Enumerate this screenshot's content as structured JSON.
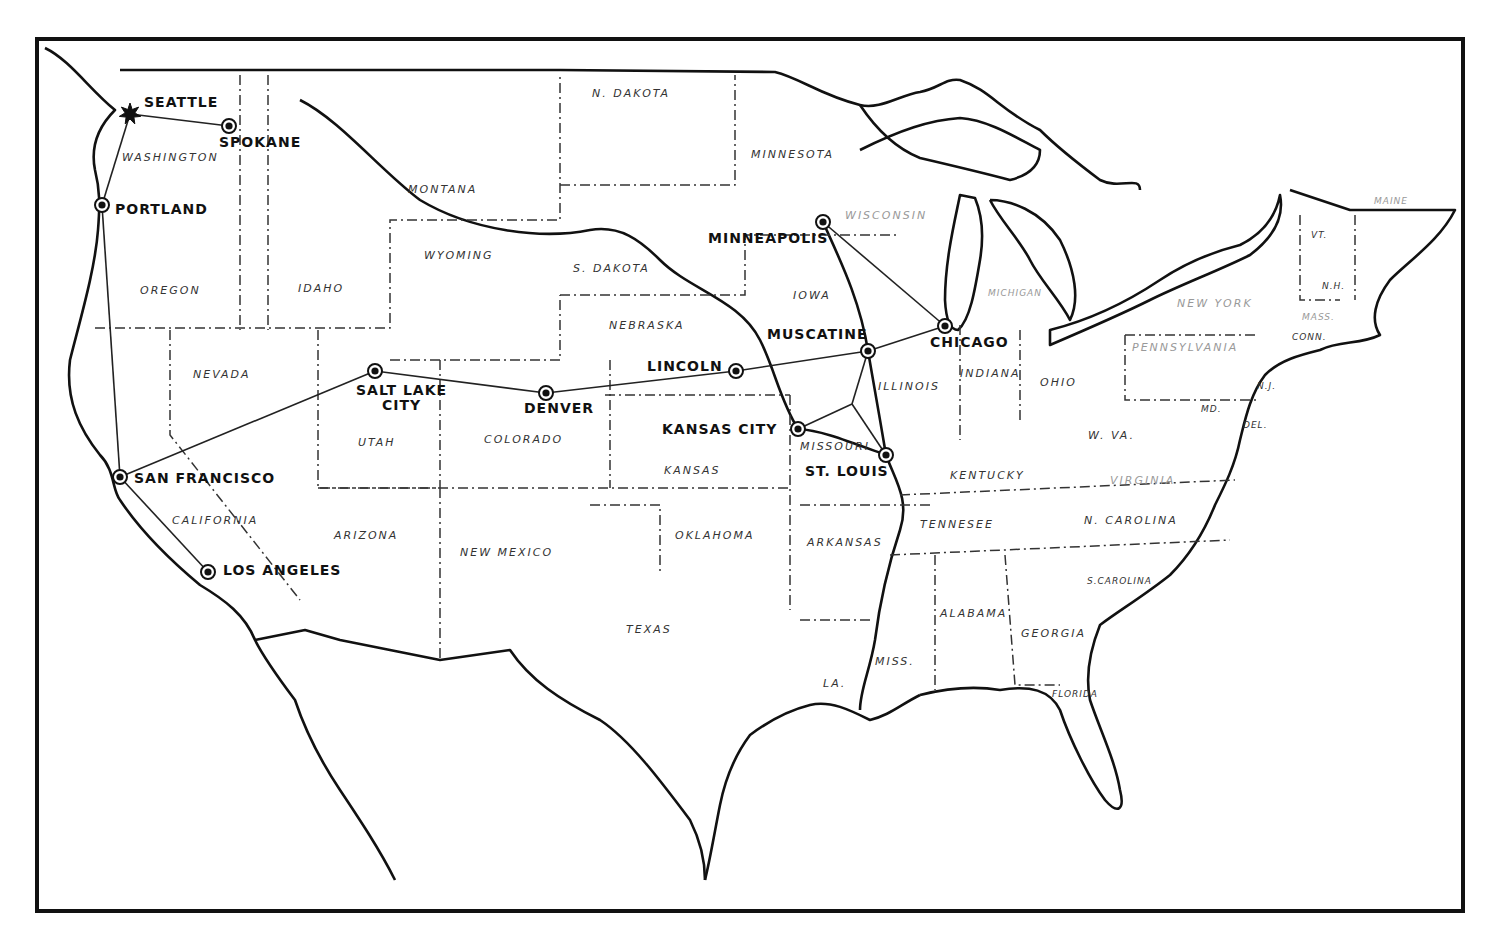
{
  "map": {
    "title": "",
    "route_color": "#222222",
    "border_color": "#111111",
    "cities": [
      {
        "id": "seattle",
        "label": "SEATTLE",
        "x": 130,
        "y": 114,
        "marker": "star-icon",
        "label_x": 144,
        "label_y": 95
      },
      {
        "id": "spokane",
        "label": "SPOKANE",
        "x": 229,
        "y": 126,
        "marker": "circle-dot-icon",
        "label_x": 219,
        "label_y": 135
      },
      {
        "id": "portland",
        "label": "PORTLAND",
        "x": 102,
        "y": 205,
        "marker": "circle-dot-icon",
        "label_x": 115,
        "label_y": 202
      },
      {
        "id": "san_francisco",
        "label": "SAN FRANCISCO",
        "x": 120,
        "y": 477,
        "marker": "circle-dot-icon",
        "label_x": 134,
        "label_y": 471
      },
      {
        "id": "los_angeles",
        "label": "LOS ANGELES",
        "x": 208,
        "y": 572,
        "marker": "circle-dot-icon",
        "label_x": 223,
        "label_y": 563
      },
      {
        "id": "salt_lake_city",
        "label": "SALT LAKE\nCITY",
        "label_line1": "SALT LAKE",
        "label_line2": "CITY",
        "x": 375,
        "y": 371,
        "marker": "circle-dot-icon",
        "label_x": 356,
        "label_y": 383
      },
      {
        "id": "denver",
        "label": "DENVER",
        "x": 546,
        "y": 393,
        "marker": "circle-dot-icon",
        "label_x": 524,
        "label_y": 401
      },
      {
        "id": "lincoln",
        "label": "LINCOLN",
        "x": 736,
        "y": 371,
        "marker": "circle-dot-icon",
        "label_x": 647,
        "label_y": 359
      },
      {
        "id": "muscatine",
        "label": "MUSCATINE",
        "x": 868,
        "y": 351,
        "marker": "circle-dot-icon",
        "label_x": 767,
        "label_y": 327
      },
      {
        "id": "chicago",
        "label": "CHICAGO",
        "x": 945,
        "y": 326,
        "marker": "circle-dot-icon",
        "label_x": 930,
        "label_y": 335
      },
      {
        "id": "minneapolis",
        "label": "MINNEAPOLIS",
        "x": 823,
        "y": 222,
        "marker": "circle-dot-icon",
        "label_x": 708,
        "label_y": 231
      },
      {
        "id": "kansas_city",
        "label": "KANSAS CITY",
        "x": 798,
        "y": 429,
        "marker": "circle-dot-icon",
        "label_x": 662,
        "label_y": 422
      },
      {
        "id": "st_louis",
        "label": "ST. LOUIS",
        "x": 886,
        "y": 455,
        "marker": "circle-dot-icon",
        "label_x": 805,
        "label_y": 464
      }
    ],
    "route_junction": {
      "x": 852,
      "y": 404
    },
    "route_segments": [
      [
        "seattle",
        "spokane"
      ],
      [
        "seattle",
        "portland"
      ],
      [
        "portland",
        "san_francisco"
      ],
      [
        "san_francisco",
        "los_angeles"
      ],
      [
        "san_francisco",
        "salt_lake_city"
      ],
      [
        "salt_lake_city",
        "denver"
      ],
      [
        "denver",
        "lincoln"
      ],
      [
        "lincoln",
        "muscatine"
      ],
      [
        "muscatine",
        "chicago"
      ],
      [
        "minneapolis",
        "chicago"
      ],
      [
        "muscatine",
        "junction"
      ],
      [
        "junction",
        "kansas_city"
      ],
      [
        "junction",
        "st_louis"
      ]
    ],
    "states": [
      {
        "label": "WASHINGTON",
        "x": 122,
        "y": 151
      },
      {
        "label": "OREGON",
        "x": 140,
        "y": 284
      },
      {
        "label": "IDAHO",
        "x": 298,
        "y": 282
      },
      {
        "label": "MONTANA",
        "x": 408,
        "y": 183
      },
      {
        "label": "WYOMING",
        "x": 424,
        "y": 249
      },
      {
        "label": "N. DAKOTA",
        "x": 592,
        "y": 87
      },
      {
        "label": "S. DAKOTA",
        "x": 573,
        "y": 262
      },
      {
        "label": "NEBRASKA",
        "x": 609,
        "y": 319
      },
      {
        "label": "MINNESOTA",
        "x": 751,
        "y": 148
      },
      {
        "label": "WISCONSIN",
        "x": 845,
        "y": 209
      },
      {
        "label": "IOWA",
        "x": 793,
        "y": 289
      },
      {
        "label": "MICHIGAN",
        "x": 988,
        "y": 288
      },
      {
        "label": "NEVADA",
        "x": 193,
        "y": 368
      },
      {
        "label": "UTAH",
        "x": 358,
        "y": 436
      },
      {
        "label": "COLORADO",
        "x": 484,
        "y": 433
      },
      {
        "label": "CALIFORNIA",
        "x": 172,
        "y": 514
      },
      {
        "label": "ARIZONA",
        "x": 334,
        "y": 529
      },
      {
        "label": "NEW MEXICO",
        "x": 460,
        "y": 546
      },
      {
        "label": "KANSAS",
        "x": 664,
        "y": 464
      },
      {
        "label": "MISSOURI",
        "x": 800,
        "y": 440
      },
      {
        "label": "ILLINOIS",
        "x": 878,
        "y": 380
      },
      {
        "label": "INDIANA",
        "x": 960,
        "y": 367
      },
      {
        "label": "OHIO",
        "x": 1040,
        "y": 376
      },
      {
        "label": "OKLAHOMA",
        "x": 675,
        "y": 529
      },
      {
        "label": "TEXAS",
        "x": 626,
        "y": 623
      },
      {
        "label": "ARKANSAS",
        "x": 807,
        "y": 536
      },
      {
        "label": "LA.",
        "x": 823,
        "y": 677
      },
      {
        "label": "MISS.",
        "x": 875,
        "y": 655
      },
      {
        "label": "ALABAMA",
        "x": 940,
        "y": 607
      },
      {
        "label": "GEORGIA",
        "x": 1021,
        "y": 627
      },
      {
        "label": "FLORIDA",
        "x": 1052,
        "y": 689
      },
      {
        "label": "TENNESEE",
        "x": 920,
        "y": 518
      },
      {
        "label": "KENTUCKY",
        "x": 950,
        "y": 469
      },
      {
        "label": "VIRGINIA",
        "x": 1110,
        "y": 474
      },
      {
        "label": "W. VA.",
        "x": 1088,
        "y": 429
      },
      {
        "label": "N. CAROLINA",
        "x": 1084,
        "y": 514
      },
      {
        "label": "S.CAROLINA",
        "x": 1087,
        "y": 576
      },
      {
        "label": "PENNSYLVANIA",
        "x": 1132,
        "y": 341
      },
      {
        "label": "NEW YORK",
        "x": 1177,
        "y": 297
      },
      {
        "label": "MD.",
        "x": 1201,
        "y": 404
      },
      {
        "label": "N.J.",
        "x": 1257,
        "y": 381
      },
      {
        "label": "DEL.",
        "x": 1243,
        "y": 420
      },
      {
        "label": "CONN.",
        "x": 1292,
        "y": 332
      },
      {
        "label": "MASS.",
        "x": 1302,
        "y": 312
      },
      {
        "label": "N.H.",
        "x": 1322,
        "y": 281
      },
      {
        "label": "VT.",
        "x": 1311,
        "y": 230
      },
      {
        "label": "MAINE",
        "x": 1374,
        "y": 196
      }
    ]
  }
}
